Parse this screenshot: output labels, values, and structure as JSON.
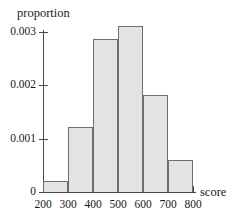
{
  "chart_data": {
    "type": "bar",
    "title": "",
    "subtitle": "",
    "xlabel": "score",
    "ylabel": "proportion",
    "grid": false,
    "legend": null,
    "bin_width": 100,
    "bin_edges": [
      200,
      300,
      400,
      500,
      600,
      700,
      800
    ],
    "categories": [
      "200-300",
      "300-400",
      "400-500",
      "500-600",
      "600-700",
      "700-800"
    ],
    "values": [
      0.0002,
      0.00122,
      0.00287,
      0.00311,
      0.00182,
      0.0006
    ],
    "xlim": [
      200,
      800
    ],
    "ylim": [
      0,
      0.00325
    ],
    "xticks": [
      200,
      300,
      400,
      500,
      600,
      700,
      800
    ],
    "xtick_labels": [
      "200",
      "300",
      "400",
      "500",
      "600",
      "700",
      "800"
    ],
    "yticks": [
      0,
      0.001,
      0.002,
      0.003
    ],
    "ytick_labels": [
      "0",
      "0.001",
      "0.002",
      "0.003"
    ],
    "bar_fill_color": "#e3e3e1",
    "bar_edge_color": "#6e6e6e",
    "axis_color": "#4a4a4a",
    "background_color": "#ffffff"
  }
}
